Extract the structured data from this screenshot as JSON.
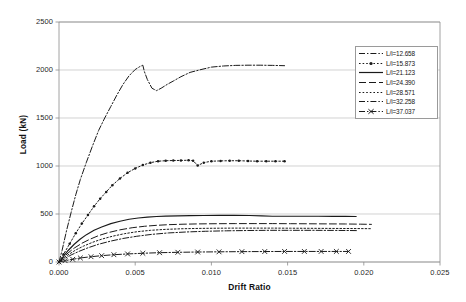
{
  "chart_data": {
    "type": "line",
    "title": "",
    "xlabel": "Drift Ratio",
    "ylabel": "Load (kN)",
    "xlim": [
      0.0,
      0.025
    ],
    "ylim": [
      0,
      2500
    ],
    "xticks": [
      "0.000",
      "0.005",
      "0.010",
      "0.015",
      "0.020",
      "0.025"
    ],
    "xtick_values": [
      0.0,
      0.005,
      0.01,
      0.015,
      0.02,
      0.025
    ],
    "yticks": [
      "0",
      "500",
      "1000",
      "1500",
      "2000",
      "2500"
    ],
    "ytick_values": [
      0,
      500,
      1000,
      1500,
      2000,
      2500
    ],
    "grid": "horizontal",
    "legend_position": "top-right",
    "series": [
      {
        "name": "L/i=12.658",
        "style": "dash-dot",
        "marker": "none",
        "color": "#1a1a1a",
        "x": [
          0.0,
          0.0002,
          0.0005,
          0.0008,
          0.0011,
          0.0014,
          0.0018,
          0.0022,
          0.0026,
          0.003,
          0.0034,
          0.0038,
          0.0042,
          0.0046,
          0.005,
          0.0053,
          0.0055,
          0.0056,
          0.0058,
          0.0061,
          0.0064,
          0.0067,
          0.0071,
          0.0075,
          0.008,
          0.0086,
          0.0092,
          0.01,
          0.0108,
          0.0116,
          0.0124,
          0.0132,
          0.014,
          0.0148
        ],
        "y": [
          0,
          120,
          330,
          520,
          700,
          860,
          1040,
          1210,
          1370,
          1500,
          1620,
          1740,
          1850,
          1940,
          2005,
          2035,
          2050,
          1985,
          1900,
          1810,
          1785,
          1810,
          1850,
          1885,
          1930,
          1975,
          2000,
          2030,
          2042,
          2048,
          2050,
          2050,
          2048,
          2045
        ]
      },
      {
        "name": "L/i=15.873",
        "style": "dotted",
        "marker": "dot",
        "color": "#1a1a1a",
        "x": [
          0.0,
          0.0003,
          0.0007,
          0.0011,
          0.0015,
          0.0019,
          0.0023,
          0.0027,
          0.0031,
          0.0035,
          0.004,
          0.0045,
          0.005,
          0.0055,
          0.006,
          0.0065,
          0.007,
          0.0075,
          0.008,
          0.0085,
          0.0088,
          0.0091,
          0.0095,
          0.01,
          0.0106,
          0.0112,
          0.0118,
          0.0124,
          0.013,
          0.0136,
          0.0142,
          0.0148
        ],
        "y": [
          0,
          80,
          190,
          300,
          400,
          490,
          580,
          660,
          730,
          800,
          870,
          930,
          975,
          1010,
          1035,
          1050,
          1055,
          1057,
          1058,
          1060,
          1055,
          1005,
          1035,
          1050,
          1053,
          1055,
          1055,
          1052,
          1050,
          1050,
          1050,
          1050
        ]
      },
      {
        "name": "L/i=21.123",
        "style": "solid",
        "marker": "none",
        "color": "#1a1a1a",
        "x": [
          0.0,
          0.0003,
          0.0006,
          0.001,
          0.0014,
          0.0018,
          0.0023,
          0.0028,
          0.0034,
          0.004,
          0.0046,
          0.0052,
          0.0058,
          0.0064,
          0.007,
          0.0078,
          0.0086,
          0.0095,
          0.0105,
          0.0115,
          0.0125,
          0.0133,
          0.014,
          0.015,
          0.016,
          0.017,
          0.018,
          0.0188,
          0.0195
        ],
        "y": [
          0,
          60,
          120,
          185,
          240,
          285,
          330,
          365,
          400,
          425,
          445,
          458,
          468,
          474,
          478,
          481,
          483,
          484,
          485,
          485,
          484,
          480,
          477,
          477,
          477,
          477,
          476,
          475,
          474
        ]
      },
      {
        "name": "L/i=24.390",
        "style": "long-dash",
        "marker": "none",
        "color": "#1a1a1a",
        "x": [
          0.0,
          0.0003,
          0.0006,
          0.001,
          0.0015,
          0.002,
          0.0026,
          0.0032,
          0.004,
          0.0048,
          0.0056,
          0.0064,
          0.0072,
          0.0082,
          0.0092,
          0.0104,
          0.0116,
          0.0128,
          0.014,
          0.0152,
          0.0164,
          0.0176,
          0.0188,
          0.0198,
          0.0205
        ],
        "y": [
          0,
          48,
          95,
          145,
          195,
          235,
          275,
          305,
          335,
          357,
          372,
          382,
          389,
          394,
          397,
          399,
          400,
          400,
          400,
          399,
          398,
          397,
          396,
          394,
          392
        ]
      },
      {
        "name": "L/i=28.571",
        "style": "dotted",
        "marker": "none",
        "color": "#1a1a1a",
        "x": [
          0.0,
          0.0003,
          0.0007,
          0.0011,
          0.0016,
          0.0022,
          0.0028,
          0.0035,
          0.0043,
          0.0051,
          0.006,
          0.007,
          0.008,
          0.0092,
          0.0104,
          0.0116,
          0.0128,
          0.014,
          0.0152,
          0.0164,
          0.0176,
          0.0188,
          0.0198,
          0.0205
        ],
        "y": [
          0,
          42,
          85,
          125,
          165,
          205,
          238,
          268,
          295,
          315,
          330,
          340,
          346,
          350,
          352,
          353,
          353,
          353,
          352,
          351,
          350,
          349,
          348,
          347
        ]
      },
      {
        "name": "L/i=32.258",
        "style": "dash-dot",
        "marker": "none",
        "color": "#1a1a1a",
        "x": [
          0.0,
          0.0004,
          0.0008,
          0.0013,
          0.0019,
          0.0026,
          0.0034,
          0.0042,
          0.0051,
          0.0061,
          0.0072,
          0.0084,
          0.0096,
          0.011,
          0.0124,
          0.0138,
          0.0152,
          0.0166,
          0.018,
          0.019,
          0.0196
        ],
        "y": [
          0,
          38,
          74,
          110,
          148,
          185,
          218,
          245,
          268,
          288,
          303,
          313,
          320,
          325,
          328,
          330,
          330,
          330,
          329,
          328,
          327
        ]
      },
      {
        "name": "L/i=37.037",
        "style": "dash-dot",
        "marker": "cross",
        "color": "#1a1a1a",
        "x": [
          0.0,
          0.0004,
          0.0009,
          0.0014,
          0.0021,
          0.0028,
          0.0036,
          0.0045,
          0.0055,
          0.0066,
          0.0078,
          0.0091,
          0.0105,
          0.012,
          0.0135,
          0.0148,
          0.0161,
          0.0172,
          0.0182,
          0.019
        ],
        "y": [
          0,
          14,
          28,
          42,
          55,
          66,
          76,
          84,
          91,
          97,
          101,
          104,
          106,
          108,
          109,
          110,
          110,
          110,
          110,
          110
        ]
      }
    ]
  },
  "legend": {
    "entries": [
      {
        "label": "L/i=12.658"
      },
      {
        "label": "L/i=15.873"
      },
      {
        "label": "L/i=21.123"
      },
      {
        "label": "L/i=24.390"
      },
      {
        "label": "L/i=28.571"
      },
      {
        "label": "L/i=32.258"
      },
      {
        "label": "L/i=37.037"
      }
    ]
  },
  "style": {
    "axis_color": "#8c8c8c",
    "grid_color": "#bfbfbf",
    "line_color": "#1a1a1a",
    "background": "#ffffff",
    "legend_border": "#9a9a9a"
  }
}
